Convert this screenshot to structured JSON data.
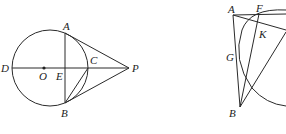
{
  "figure_left": {
    "labels": {
      "A": "A",
      "B": "B",
      "C": "C",
      "D": "D",
      "E": "E",
      "O": "O",
      "P": "P"
    }
  },
  "figure_right": {
    "labels": {
      "A": "A",
      "F": "F",
      "K": "K",
      "G": "G",
      "B": "B"
    }
  }
}
